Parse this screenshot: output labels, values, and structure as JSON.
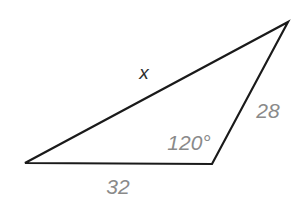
{
  "figure": {
    "background_color": "#ffffff",
    "stroke_color": "#1a1a1a",
    "stroke_width": 2.2,
    "label_gray": "#8a8a8a",
    "label_dark": "#2e2e2e"
  },
  "chart_data": {
    "type": "diagram",
    "shape": "triangle",
    "title": "",
    "xlabel": "",
    "ylabel": "",
    "vertices": [
      {
        "name": "A",
        "x": 25,
        "y": 163
      },
      {
        "name": "B",
        "x": 212,
        "y": 164
      },
      {
        "name": "C",
        "x": 288,
        "y": 22
      }
    ],
    "sides": [
      {
        "name": "AB",
        "label": "32",
        "value": 32,
        "from": "A",
        "to": "B"
      },
      {
        "name": "BC",
        "label": "28",
        "value": 28,
        "from": "B",
        "to": "C"
      },
      {
        "name": "CA",
        "label": "x",
        "value": null,
        "from": "C",
        "to": "A"
      }
    ],
    "angles": [
      {
        "at": "B",
        "label": "120°",
        "value": 120
      }
    ]
  },
  "labels": {
    "side_bottom": "32",
    "side_right": "28",
    "side_top": "x",
    "angle_b": "120°"
  }
}
